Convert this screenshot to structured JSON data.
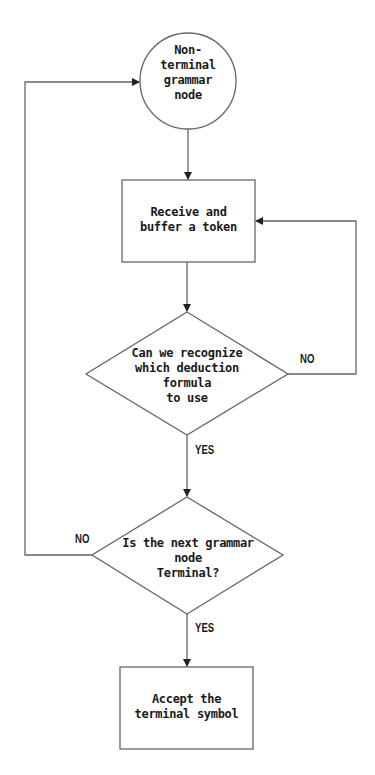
{
  "diagram": {
    "type": "flowchart",
    "colors": {
      "stroke": "#666666",
      "text": "#1a1a1a",
      "background": "#ffffff"
    },
    "nodes": [
      {
        "id": "start",
        "shape": "circle",
        "text": "Non-\nterminal\ngrammar\nnode"
      },
      {
        "id": "receive",
        "shape": "rectangle",
        "text": "Receive and\nbuffer a token"
      },
      {
        "id": "decision1",
        "shape": "diamond",
        "text": "Can we recognize\nwhich deduction\nformula\nto use"
      },
      {
        "id": "decision2",
        "shape": "diamond",
        "text": "Is the next grammar\nnode\nTerminal?"
      },
      {
        "id": "accept",
        "shape": "rectangle",
        "text": "Accept the\nterminal symbol"
      }
    ],
    "edges": [
      {
        "from": "start",
        "to": "receive",
        "label": ""
      },
      {
        "from": "receive",
        "to": "decision1",
        "label": ""
      },
      {
        "from": "decision1",
        "to": "receive",
        "label": "NO"
      },
      {
        "from": "decision1",
        "to": "decision2",
        "label": "YES"
      },
      {
        "from": "decision2",
        "to": "start",
        "label": "NO"
      },
      {
        "from": "decision2",
        "to": "accept",
        "label": "YES"
      }
    ]
  }
}
